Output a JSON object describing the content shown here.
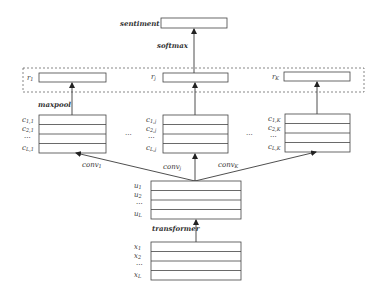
{
  "diagram": {
    "output": {
      "label": "sentiment"
    },
    "softmax": {
      "label": "softmax"
    },
    "maxpool": {
      "label": "maxpool"
    },
    "transformer": {
      "label": "transformer"
    },
    "pooled": [
      {
        "base": "r",
        "sub": "1"
      },
      {
        "base": "r",
        "sub": "j"
      },
      {
        "base": "r",
        "sub": "K"
      }
    ],
    "conv_labels": [
      {
        "base": "conv",
        "sub": "1"
      },
      {
        "base": "conv",
        "sub": "j"
      },
      {
        "base": "conv",
        "sub": "K"
      }
    ],
    "feature_maps": [
      {
        "rows": [
          {
            "base": "c",
            "sub": "1,1"
          },
          {
            "base": "c",
            "sub": "2,1"
          },
          {
            "base": "···",
            "sub": ""
          },
          {
            "base": "c",
            "sub": "L,1"
          }
        ]
      },
      {
        "rows": [
          {
            "base": "c",
            "sub": "1,j"
          },
          {
            "base": "c",
            "sub": "2,j"
          },
          {
            "base": "···",
            "sub": ""
          },
          {
            "base": "c",
            "sub": "L,j"
          }
        ]
      },
      {
        "rows": [
          {
            "base": "c",
            "sub": "1,K"
          },
          {
            "base": "c",
            "sub": "2,K"
          },
          {
            "base": "···",
            "sub": ""
          },
          {
            "base": "c",
            "sub": "L,K"
          }
        ]
      }
    ],
    "ellipsis": "...",
    "u_rows": [
      {
        "base": "u",
        "sub": "1"
      },
      {
        "base": "u",
        "sub": "2"
      },
      {
        "base": "···",
        "sub": ""
      },
      {
        "base": "u",
        "sub": "L"
      }
    ],
    "x_rows": [
      {
        "base": "x",
        "sub": "1"
      },
      {
        "base": "x",
        "sub": "2"
      },
      {
        "base": "···",
        "sub": ""
      },
      {
        "base": "x",
        "sub": "L"
      }
    ]
  }
}
